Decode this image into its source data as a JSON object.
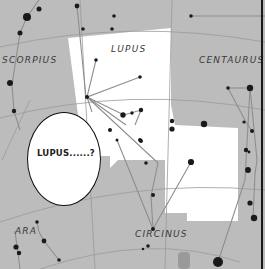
{
  "panel": {
    "description": "Manga panel over a star chart of the Lupus region",
    "background_color": "#bcbcbc",
    "highlight_color": "#ffffff",
    "line_color": "#8e8e8e",
    "star_color": "#1a1a1a"
  },
  "constellation_labels": {
    "scorpius": "SCORPIUS",
    "lupus": "LUPUS",
    "centaurus": "CENTAURUS",
    "ara": "ARA",
    "circinus": "CIRCINUS"
  },
  "speech_bubble": {
    "text": "LUPUS......?"
  }
}
